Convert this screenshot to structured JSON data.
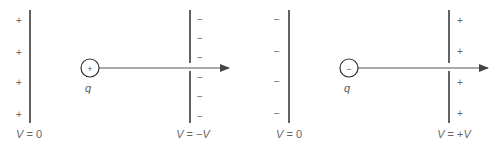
{
  "diagram": {
    "panels": [
      {
        "id": "positive-charge",
        "left_plate": {
          "sign": "+",
          "signs_count": 4,
          "label_var": "V",
          "label_rest": " = 0"
        },
        "charge": {
          "symbol": "+",
          "label": "q"
        },
        "right_plate": {
          "sign": "−",
          "signs_count": 6,
          "label_var": "V",
          "label_mid": " = −",
          "label_var2": "V"
        },
        "arrow": "rightward"
      },
      {
        "id": "negative-charge",
        "left_plate": {
          "sign": "−",
          "signs_count": 4,
          "label_var": "V",
          "label_rest": " = 0"
        },
        "charge": {
          "symbol": "−",
          "label": "q"
        },
        "right_plate": {
          "sign": "+",
          "signs_count": 4,
          "label_var": "V",
          "label_mid": " = +",
          "label_var2": "V"
        },
        "arrow": "rightward"
      }
    ]
  },
  "colors": {
    "plate": "#3a3a3a",
    "arrow": "#555555",
    "text": "#666666",
    "background": "#ffffff"
  }
}
